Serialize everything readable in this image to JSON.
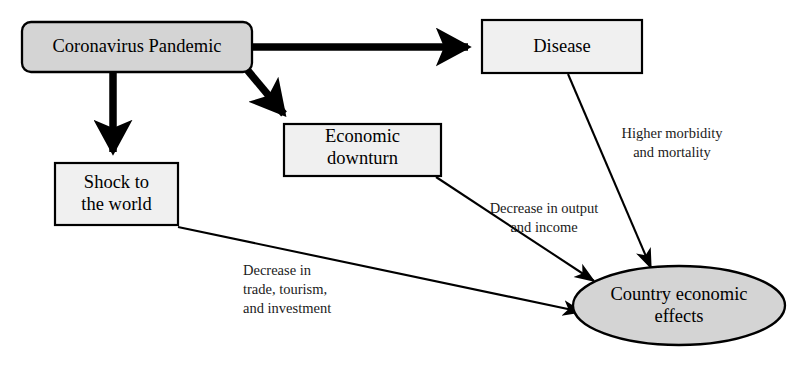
{
  "diagram": {
    "colors": {
      "node_fill_shaded": "#d4d4d4",
      "node_fill_light": "#f0f0f0",
      "stroke": "#000000",
      "text": "#000000",
      "background": "#ffffff"
    },
    "nodes": [
      {
        "id": "coronavirus-pandemic",
        "label": "Coronavirus Pandemic",
        "shape": "rounded-rectangle",
        "fill": "#d4d4d4",
        "x": 22,
        "y": 22,
        "width": 230,
        "height": 50,
        "font_size": 18.5
      },
      {
        "id": "disease",
        "label": "Disease",
        "shape": "rectangle",
        "fill": "#f0f0f0",
        "x": 482,
        "y": 20,
        "width": 160,
        "height": 53,
        "font_size": 18.5
      },
      {
        "id": "economic-downturn",
        "label": "Economic\ndownturn",
        "shape": "rectangle",
        "fill": "#f0f0f0",
        "x": 284,
        "y": 124,
        "width": 157,
        "height": 52,
        "font_size": 18.5
      },
      {
        "id": "shock-to-the-world",
        "label": "Shock to\nthe world",
        "shape": "rectangle",
        "fill": "#f0f0f0",
        "x": 55,
        "y": 163,
        "width": 123,
        "height": 62,
        "font_size": 18.5
      },
      {
        "id": "country-economic-effects",
        "label": "Country economic\neffects",
        "shape": "ellipse",
        "fill": "#d4d4d4",
        "x": 573,
        "y": 266,
        "width": 212,
        "height": 79,
        "font_size": 18.5
      }
    ],
    "edges": [
      {
        "id": "pandemic-to-disease",
        "from": "coronavirus-pandemic",
        "to": "disease",
        "style": "thick",
        "label": ""
      },
      {
        "id": "pandemic-to-shock",
        "from": "coronavirus-pandemic",
        "to": "shock-to-the-world",
        "style": "thick",
        "label": ""
      },
      {
        "id": "pandemic-to-downturn",
        "from": "coronavirus-pandemic",
        "to": "economic-downturn",
        "style": "thick",
        "label": ""
      },
      {
        "id": "disease-to-effects",
        "from": "disease",
        "to": "country-economic-effects",
        "style": "thin",
        "label": "Higher morbidity\nand mortality"
      },
      {
        "id": "downturn-to-effects",
        "from": "economic-downturn",
        "to": "country-economic-effects",
        "style": "thin",
        "label": "Decrease in output\nand income"
      },
      {
        "id": "shock-to-effects",
        "from": "shock-to-the-world",
        "to": "country-economic-effects",
        "style": "thin",
        "label": "Decrease in\ntrade, tourism,\nand investment"
      }
    ],
    "edge_labels": {
      "higher_morbidity": "Higher morbidity\nand mortality",
      "decrease_output": "Decrease in output\nand income",
      "decrease_trade": "Decrease in\ntrade, tourism,\nand investment"
    }
  }
}
